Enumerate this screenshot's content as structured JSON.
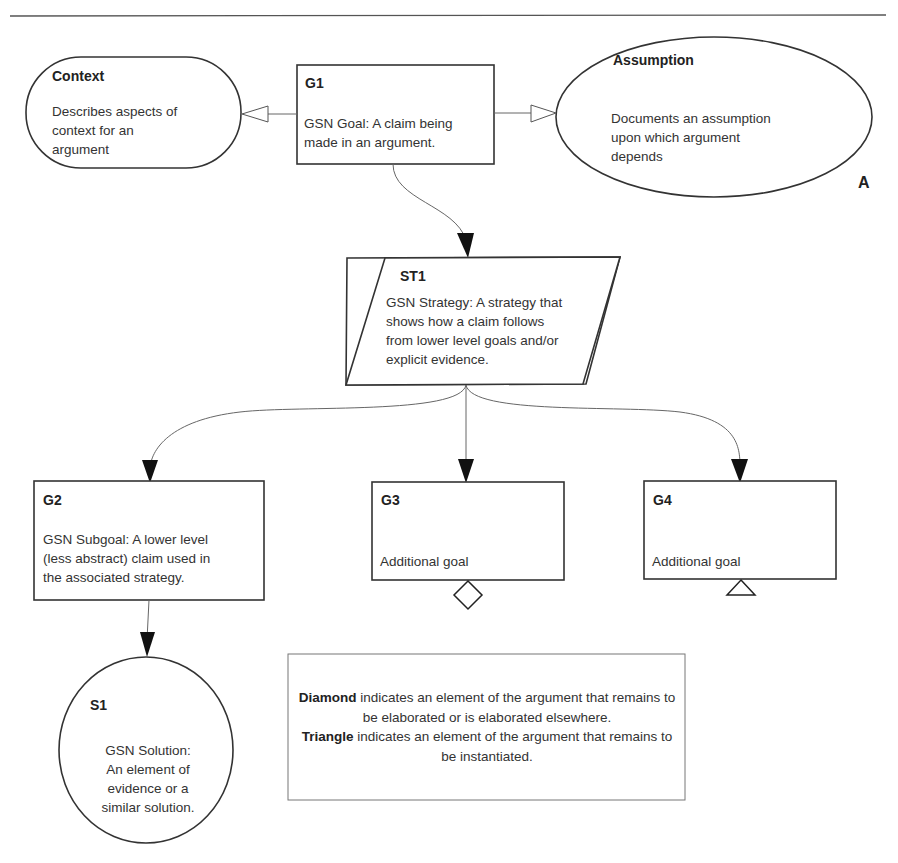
{
  "diagram": {
    "notation": "GSN",
    "corner_label": "A",
    "nodes": {
      "context": {
        "title": "Context",
        "text": "Describes aspects of context for an argument",
        "lines": [
          "Describes aspects of",
          "context for an",
          "argument"
        ],
        "shape": "stadium"
      },
      "g1": {
        "title": "G1",
        "text": "GSN Goal: A claim being made in an argument.",
        "lines": [
          "GSN Goal: A claim being",
          "made in an argument."
        ],
        "shape": "rectangle"
      },
      "assumption": {
        "title": "Assumption",
        "text": "Documents an assumption upon which argument depends",
        "lines": [
          "Documents an assumption",
          "upon which argument",
          "depends"
        ],
        "shape": "ellipse"
      },
      "st1": {
        "title": "ST1",
        "text": "GSN Strategy: A strategy that shows how a claim follows from lower level goals and/or explicit evidence.",
        "lines": [
          "GSN Strategy: A strategy that",
          "shows how a claim follows",
          "from lower level goals and/or",
          "explicit evidence."
        ],
        "shape": "parallelogram"
      },
      "g2": {
        "title": "G2",
        "text": "GSN Subgoal: A lower level (less abstract) claim used in the associated strategy.",
        "lines": [
          "GSN Subgoal: A lower level",
          "(less abstract) claim used in",
          "the associated strategy."
        ],
        "shape": "rectangle"
      },
      "g3": {
        "title": "G3",
        "text": "Additional goal",
        "shape": "rectangle",
        "decorator": "diamond"
      },
      "g4": {
        "title": "G4",
        "text": "Additional goal",
        "shape": "rectangle",
        "decorator": "triangle"
      },
      "s1": {
        "title": "S1",
        "text": "GSN Solution: An element of evidence or a similar solution.",
        "lines": [
          "GSN Solution:",
          "An element of",
          "evidence or a",
          "similar solution."
        ],
        "shape": "circle"
      }
    },
    "edges": [
      {
        "from": "G1",
        "to": "Context",
        "type": "in-context-of"
      },
      {
        "from": "G1",
        "to": "Assumption",
        "type": "in-context-of"
      },
      {
        "from": "G1",
        "to": "ST1",
        "type": "supported-by"
      },
      {
        "from": "ST1",
        "to": "G2",
        "type": "supported-by"
      },
      {
        "from": "ST1",
        "to": "G3",
        "type": "supported-by"
      },
      {
        "from": "ST1",
        "to": "G4",
        "type": "supported-by"
      },
      {
        "from": "G2",
        "to": "S1",
        "type": "supported-by"
      }
    ],
    "legend": {
      "diamond_term": "Diamond",
      "diamond_line1": "indicates an element of the argument that remains to",
      "diamond_line2": "be elaborated or is elaborated elsewhere.",
      "triangle_term": "Triangle",
      "triangle_line1": "indicates an element of the argument that remains to",
      "triangle_line2": "be instantiated."
    }
  }
}
